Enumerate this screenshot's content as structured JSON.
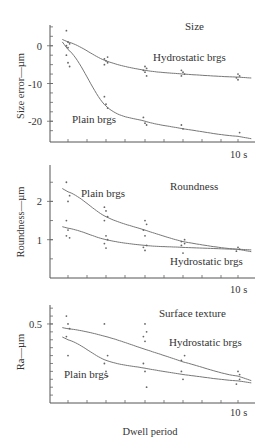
{
  "chart_data": [
    {
      "type": "scatter",
      "title": "Size",
      "xlabel": "",
      "ylabel": "Size error—µm",
      "x_end_label": "10 s",
      "ylim": [
        -25.5,
        5.5
      ],
      "yticks": [
        0,
        -10,
        -20
      ],
      "x": [
        1,
        2,
        3,
        4,
        5
      ],
      "series": [
        {
          "name": "Hydrostatic brgs",
          "values": [
            1,
            -4,
            -6.5,
            -7.5,
            -8.3
          ],
          "points": [
            [
              1,
              4
            ],
            [
              1,
              1
            ],
            [
              1,
              0.5
            ],
            [
              1,
              0
            ],
            [
              1,
              -0.5
            ],
            [
              2,
              -3
            ],
            [
              2,
              -3.5
            ],
            [
              2,
              -4
            ],
            [
              2,
              -4.5
            ],
            [
              2,
              -5
            ],
            [
              3,
              -5.5
            ],
            [
              3,
              -6
            ],
            [
              3,
              -6.5
            ],
            [
              3,
              -7
            ],
            [
              3,
              -8
            ],
            [
              4,
              -6.5
            ],
            [
              4,
              -7
            ],
            [
              4,
              -7.5
            ],
            [
              4,
              -8
            ],
            [
              5,
              -7.5
            ],
            [
              5,
              -8
            ],
            [
              5,
              -8.5
            ],
            [
              5,
              -9
            ]
          ]
        },
        {
          "name": "Plain brgs",
          "values": [
            -1,
            -16,
            -20,
            -22,
            -24
          ],
          "points": [
            [
              1,
              -2.5
            ],
            [
              1,
              -4.5
            ],
            [
              1,
              -5.5
            ],
            [
              2,
              -13.5
            ],
            [
              2,
              -15.5
            ],
            [
              2,
              -16.5
            ],
            [
              3,
              -19
            ],
            [
              3,
              -20.5
            ],
            [
              3,
              -21
            ],
            [
              4,
              -21
            ],
            [
              4,
              -22
            ],
            [
              5,
              -23
            ]
          ]
        }
      ],
      "annotations": [
        "Hydrostatic brgs",
        "Plain brgs"
      ]
    },
    {
      "type": "scatter",
      "title": "Roundness",
      "xlabel": "",
      "ylabel": "Roundness—µm",
      "x_end_label": "10 s",
      "ylim": [
        0.0,
        2.95
      ],
      "yticks": [
        2,
        1
      ],
      "x": [
        1,
        2,
        3,
        4,
        5
      ],
      "series": [
        {
          "name": "Plain brgs",
          "values": [
            2.25,
            1.6,
            1.25,
            0.95,
            0.75
          ],
          "points": [
            [
              1,
              2.5
            ],
            [
              1,
              2.0
            ],
            [
              1,
              2.15
            ],
            [
              2,
              1.85
            ],
            [
              2,
              1.75
            ],
            [
              2,
              1.6
            ],
            [
              2,
              1.5
            ],
            [
              3,
              1.5
            ],
            [
              3,
              1.4
            ],
            [
              3,
              1.25
            ],
            [
              3,
              1.1
            ],
            [
              4,
              1.0
            ],
            [
              4,
              0.95
            ],
            [
              5,
              0.8
            ]
          ]
        },
        {
          "name": "Hydrostatic brgs",
          "values": [
            1.3,
            1.0,
            0.85,
            0.8,
            0.75
          ],
          "points": [
            [
              1,
              1.5
            ],
            [
              1,
              1.25
            ],
            [
              1,
              1.05
            ],
            [
              1,
              1.1
            ],
            [
              2,
              1.1
            ],
            [
              2,
              1.0
            ],
            [
              2,
              0.9
            ],
            [
              2,
              0.78
            ],
            [
              3,
              0.85
            ],
            [
              3,
              0.8
            ],
            [
              3,
              0.72
            ],
            [
              4,
              0.9
            ],
            [
              4,
              0.85
            ],
            [
              4,
              0.65
            ],
            [
              5,
              0.75
            ],
            [
              5,
              0.7
            ]
          ]
        }
      ],
      "annotations": [
        "Plain brgs",
        "Hydrostatic brgs"
      ]
    },
    {
      "type": "scatter",
      "title": "Surface texture",
      "xlabel": "Dwell period",
      "ylabel": "Ra—µm",
      "x_end_label": "10 s",
      "ylim": [
        0.0,
        0.62
      ],
      "yticks": [
        0.5
      ],
      "x": [
        1,
        2,
        3,
        4,
        5
      ],
      "series": [
        {
          "name": "Hydrostatic brgs",
          "values": [
            0.47,
            0.42,
            0.34,
            0.26,
            0.17
          ],
          "points": [
            [
              1,
              0.55
            ],
            [
              1,
              0.5
            ],
            [
              1,
              0.47
            ],
            [
              2,
              0.5
            ],
            [
              3,
              0.5
            ],
            [
              3,
              0.45
            ],
            [
              3,
              0.42
            ],
            [
              3,
              0.39
            ],
            [
              4,
              0.3
            ],
            [
              4,
              0.27
            ],
            [
              5,
              0.2
            ],
            [
              5,
              0.18
            ]
          ]
        },
        {
          "name": "Plain brgs",
          "values": [
            0.4,
            0.27,
            0.22,
            0.18,
            0.14
          ],
          "points": [
            [
              1,
              0.42
            ],
            [
              1,
              0.3
            ],
            [
              2,
              0.3
            ],
            [
              2,
              0.25
            ],
            [
              2,
              0.2
            ],
            [
              2,
              0.17
            ],
            [
              3,
              0.25
            ],
            [
              3,
              0.2
            ],
            [
              3,
              0.1
            ],
            [
              4,
              0.2
            ],
            [
              4,
              0.15
            ],
            [
              5,
              0.15
            ],
            [
              5,
              0.12
            ]
          ]
        }
      ],
      "annotations": [
        "Surface texture",
        "Hydrostatic brgs",
        "Plain brgs"
      ]
    }
  ]
}
